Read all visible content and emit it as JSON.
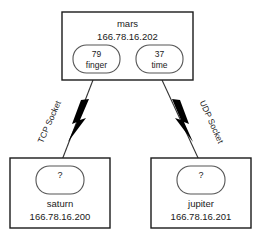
{
  "diagram": {
    "nodes": {
      "server": {
        "name": "mars",
        "ip": "166.78.16.202",
        "services": [
          {
            "port": "79",
            "service": "finger"
          },
          {
            "port": "37",
            "service": "time"
          }
        ]
      },
      "client_left": {
        "name": "saturn",
        "ip": "166.78.16.200",
        "port": "?"
      },
      "client_right": {
        "name": "jupiter",
        "ip": "166.78.16.201",
        "port": "?"
      }
    },
    "connections": [
      {
        "label": "TCP Socket",
        "from": "saturn",
        "to": "mars:79"
      },
      {
        "label": "UDP Socket",
        "from": "jupiter",
        "to": "mars:37"
      }
    ],
    "colors": {
      "line": "#333333",
      "box_border": "#1a1a1a",
      "port_border": "#555555",
      "text": "#1a1a1a",
      "background": "#ffffff",
      "bolt": "#000000"
    }
  }
}
